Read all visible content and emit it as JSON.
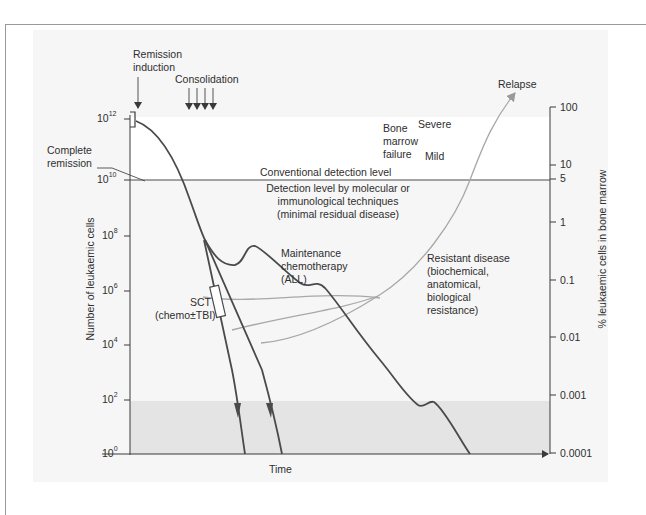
{
  "diagram": {
    "type": "leukaemia treatment response schematic",
    "left_axis": {
      "label": "Number of leukaemic cells",
      "ticks": [
        {
          "base": "10",
          "exp": "12"
        },
        {
          "base": "10",
          "exp": "10"
        },
        {
          "base": "10",
          "exp": "8"
        },
        {
          "base": "10",
          "exp": "6"
        },
        {
          "base": "10",
          "exp": "4"
        },
        {
          "base": "10",
          "exp": "2"
        },
        {
          "base": "10",
          "exp": "0"
        }
      ]
    },
    "right_axis": {
      "label": "% leukaemic cells in bone marrow",
      "ticks": [
        "100",
        "10",
        "5",
        "1",
        "0.1",
        "0.01",
        "0.001",
        "0.0001"
      ]
    },
    "x_axis": {
      "label": "Time"
    },
    "annotations": {
      "remission_induction": [
        "Remission",
        "induction"
      ],
      "consolidation": "Consolidation",
      "complete_remission": [
        "Complete",
        "remission"
      ],
      "conventional_detection": "Conventional detection level",
      "molecular_detection": [
        "Detection level by molecular or",
        "immunological techniques",
        "(minimal residual disease)"
      ],
      "maintenance": [
        "Maintenance",
        "chemotherapy",
        "(ALL)"
      ],
      "sct": [
        "SCT",
        "(chemo±TBI)"
      ],
      "bone_marrow_failure": [
        "Bone",
        "marrow",
        "failure"
      ],
      "severe": "Severe",
      "mild": "Mild",
      "relapse": "Relapse",
      "resistant_disease": [
        "Resistant disease",
        "(biochemical,",
        "anatomical,",
        "biological",
        "resistance)"
      ]
    },
    "colors": {
      "panel_bg": "#f6f6f6",
      "upper_band": "#ffffff",
      "shaded_band": "#e4e4e4",
      "main_curve": "#4a4a4a",
      "relapse_curve": "#a8a8a8",
      "axis": "#3a3a3a",
      "frame": "#9a9a9a"
    }
  }
}
